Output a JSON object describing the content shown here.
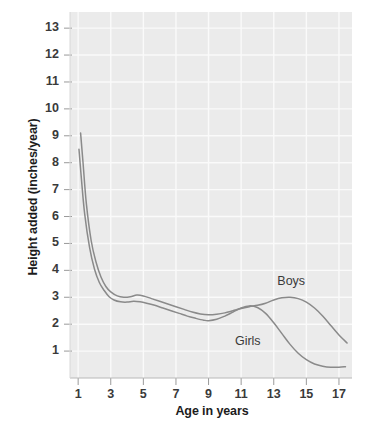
{
  "chart_data": {
    "type": "line",
    "title": "",
    "xlabel": "Age in years",
    "ylabel": "Height added (inches/year)",
    "xlim": [
      0.5,
      17.8
    ],
    "ylim": [
      0.0,
      13.6
    ],
    "xticks": [
      "1",
      "3",
      "5",
      "7",
      "9",
      "11",
      "13",
      "15",
      "17"
    ],
    "xtick_values": [
      1,
      3,
      5,
      7,
      9,
      11,
      13,
      15,
      17
    ],
    "yticks": [
      "1",
      "2",
      "3",
      "4",
      "5",
      "6",
      "7",
      "8",
      "9",
      "10",
      "11",
      "12",
      "13"
    ],
    "ytick_values": [
      1,
      2,
      3,
      4,
      5,
      6,
      7,
      8,
      9,
      10,
      11,
      12,
      13
    ],
    "grid": true,
    "legend_position": "inline-annotation",
    "plot_background": "#ebebeb",
    "line_color": "#8a8a8a",
    "annotations": [
      {
        "text": "Boys",
        "x": 14.2,
        "y": 3.55
      },
      {
        "text": "Girls",
        "x": 11.6,
        "y": 1.35
      }
    ],
    "series": [
      {
        "name": "Boys",
        "color": "#8a8a8a",
        "x": [
          1.15,
          1.3,
          1.5,
          1.8,
          2.1,
          2.4,
          2.7,
          3.0,
          3.4,
          3.8,
          4.2,
          4.6,
          5.0,
          5.5,
          6.0,
          6.5,
          7.0,
          7.5,
          8.0,
          8.5,
          9.0,
          9.5,
          10.0,
          10.5,
          11.0,
          11.5,
          12.0,
          12.5,
          13.0,
          13.5,
          14.0,
          14.5,
          15.0,
          15.5,
          16.0,
          16.5,
          17.0,
          17.5
        ],
        "y": [
          9.1,
          8.0,
          6.5,
          5.1,
          4.3,
          3.75,
          3.4,
          3.2,
          3.05,
          3.0,
          3.02,
          3.08,
          3.05,
          2.95,
          2.85,
          2.75,
          2.65,
          2.55,
          2.45,
          2.38,
          2.35,
          2.37,
          2.42,
          2.5,
          2.58,
          2.65,
          2.7,
          2.78,
          2.9,
          2.98,
          3.0,
          2.95,
          2.82,
          2.6,
          2.3,
          1.95,
          1.6,
          1.3
        ]
      },
      {
        "name": "Girls",
        "color": "#8a8a8a",
        "x": [
          1.05,
          1.2,
          1.4,
          1.7,
          2.0,
          2.3,
          2.6,
          2.9,
          3.2,
          3.6,
          4.0,
          4.4,
          4.8,
          5.2,
          5.7,
          6.2,
          6.7,
          7.2,
          7.7,
          8.2,
          8.7,
          9.0,
          9.5,
          10.0,
          10.5,
          11.0,
          11.5,
          12.0,
          12.5,
          13.0,
          13.5,
          14.0,
          14.5,
          15.0,
          15.5,
          16.0,
          16.5,
          17.0,
          17.4
        ],
        "y": [
          8.5,
          7.4,
          6.1,
          4.85,
          4.05,
          3.55,
          3.25,
          3.02,
          2.9,
          2.83,
          2.82,
          2.85,
          2.83,
          2.78,
          2.7,
          2.6,
          2.5,
          2.4,
          2.3,
          2.22,
          2.15,
          2.13,
          2.18,
          2.3,
          2.45,
          2.6,
          2.68,
          2.62,
          2.4,
          2.05,
          1.65,
          1.25,
          0.92,
          0.68,
          0.52,
          0.44,
          0.4,
          0.4,
          0.42
        ]
      }
    ]
  }
}
